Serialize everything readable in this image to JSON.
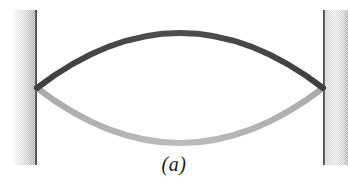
{
  "figure": {
    "caption": "(a)",
    "background_color": "#ffffff",
    "width": 348,
    "height": 184
  },
  "supports": [
    {
      "name": "left-wall",
      "label": "Left fixed support",
      "x": 12,
      "y": 10,
      "width": 25,
      "height": 155,
      "fill_light": "#f2f2f2",
      "fill_dark": "#9a9a9a",
      "edge_color": "#4d4d4d",
      "edge_side": "right"
    },
    {
      "name": "right-wall",
      "label": "Right fixed support",
      "x": 323,
      "y": 10,
      "width": 25,
      "height": 155,
      "fill_light": "#f2f2f2",
      "fill_dark": "#9a9a9a",
      "edge_color": "#4d4d4d",
      "edge_side": "left"
    }
  ],
  "chart_data": {
    "type": "line",
    "xlabel": "",
    "ylabel": "",
    "xlim": [
      37,
      323
    ],
    "ylim": [
      184,
      0
    ],
    "grid": false,
    "legend": "none",
    "annotations": [
      "(a)"
    ],
    "node_points": [
      {
        "name": "left-node",
        "x": 37,
        "y": 88
      },
      {
        "name": "right-node",
        "x": 323,
        "y": 88
      }
    ],
    "series": [
      {
        "name": "upward-displacement",
        "description": "String at maximum upward displacement",
        "color": "#4a4a4a",
        "stroke_width": 6,
        "antinode": {
          "x": 180,
          "y": 33
        },
        "x": [
          37,
          66,
          95,
          123,
          152,
          180,
          209,
          237,
          266,
          294,
          323
        ],
        "y": [
          88,
          66,
          50,
          40,
          35,
          33,
          35,
          41,
          52,
          68,
          88
        ]
      },
      {
        "name": "downward-displacement",
        "description": "String at maximum downward displacement",
        "color": "#b5b5b5",
        "stroke_width": 6,
        "antinode": {
          "x": 180,
          "y": 143
        },
        "x": [
          37,
          66,
          95,
          123,
          152,
          180,
          209,
          237,
          266,
          294,
          323
        ],
        "y": [
          88,
          106,
          121,
          132,
          140,
          143,
          141,
          135,
          125,
          109,
          88
        ]
      }
    ]
  }
}
